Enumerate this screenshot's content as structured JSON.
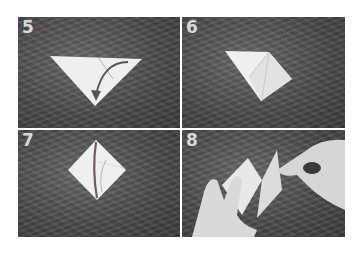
{
  "panels": [
    {
      "step": "5",
      "description": "Triangle folded paper with curved arrow indicating fold"
    },
    {
      "step": "6",
      "description": "Paper folded into smaller triangle shape with crease line"
    },
    {
      "step": "7",
      "description": "Diamond-shaped folded paper with curved crease marks"
    },
    {
      "step": "8",
      "description": "Hands folding the paper"
    }
  ],
  "colors": {
    "paper": "#efefef",
    "background": "#4c4c4c",
    "label": "#d8d8d8"
  }
}
